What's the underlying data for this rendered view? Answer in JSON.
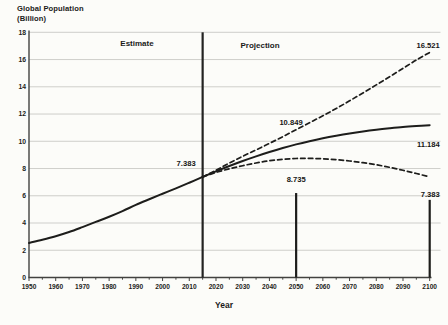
{
  "chart_data": {
    "type": "line",
    "title_line1": "Global Population",
    "title_line2": "(Billion)",
    "xlabel": "Year",
    "xlim": [
      1950,
      2100
    ],
    "ylim": [
      0,
      18
    ],
    "x_ticks": [
      1950,
      1960,
      1970,
      1980,
      1990,
      2000,
      2010,
      2020,
      2030,
      2040,
      2050,
      2060,
      2070,
      2080,
      2090,
      2100
    ],
    "x_minor_tick_step": 5,
    "y_ticks": [
      0,
      2,
      4,
      6,
      8,
      10,
      12,
      14,
      16,
      18
    ],
    "grid": "horizontal",
    "legend": "none",
    "colors": {
      "line": "#1d1d1b",
      "grid": "#cacac5",
      "axis": "#424240",
      "text": "#1b1b19",
      "background": "#fcfcf9"
    },
    "divider": {
      "year": 2015,
      "left_label": "Estimate",
      "right_label": "Projection"
    },
    "series": [
      {
        "name": "estimate",
        "line_style": "solid",
        "x": [
          1950,
          1955,
          1960,
          1965,
          1970,
          1975,
          1980,
          1985,
          1990,
          1995,
          2000,
          2005,
          2010,
          2015
        ],
        "values": [
          2.536,
          2.772,
          3.033,
          3.339,
          3.7,
          4.079,
          4.458,
          4.871,
          5.331,
          5.744,
          6.145,
          6.542,
          6.958,
          7.383
        ]
      },
      {
        "name": "high-variant",
        "line_style": "dashed",
        "x": [
          2015,
          2020,
          2025,
          2030,
          2035,
          2040,
          2045,
          2050,
          2055,
          2060,
          2065,
          2070,
          2075,
          2080,
          2085,
          2090,
          2095,
          2100
        ],
        "values": [
          7.383,
          7.877,
          8.401,
          8.897,
          9.368,
          9.846,
          10.339,
          10.849,
          11.36,
          11.873,
          12.405,
          12.968,
          13.547,
          14.139,
          14.74,
          15.351,
          15.963,
          16.521
        ]
      },
      {
        "name": "medium-variant",
        "line_style": "solid",
        "x": [
          2015,
          2020,
          2025,
          2030,
          2035,
          2040,
          2045,
          2050,
          2055,
          2060,
          2065,
          2070,
          2075,
          2080,
          2085,
          2090,
          2095,
          2100
        ],
        "values": [
          7.383,
          7.795,
          8.185,
          8.551,
          8.893,
          9.21,
          9.504,
          9.772,
          10.009,
          10.222,
          10.409,
          10.577,
          10.724,
          10.851,
          10.959,
          11.055,
          11.126,
          11.184
        ]
      },
      {
        "name": "low-variant",
        "line_style": "dashed",
        "x": [
          2015,
          2020,
          2025,
          2030,
          2035,
          2040,
          2045,
          2050,
          2055,
          2060,
          2065,
          2070,
          2075,
          2080,
          2085,
          2090,
          2095,
          2100
        ],
        "values": [
          7.383,
          7.713,
          7.981,
          8.206,
          8.406,
          8.57,
          8.673,
          8.735,
          8.744,
          8.712,
          8.651,
          8.551,
          8.429,
          8.276,
          8.086,
          7.87,
          7.634,
          7.383
        ]
      }
    ],
    "annotations": [
      {
        "id": "pop-2015",
        "text": "7.383",
        "year": 2015,
        "value": 7.383
      },
      {
        "id": "high-2050",
        "text": "10.849",
        "year": 2050,
        "value": 10.849
      },
      {
        "id": "high-2100",
        "text": "16.521",
        "year": 2100,
        "value": 16.521
      },
      {
        "id": "medium-2100",
        "text": "11.184",
        "year": 2100,
        "value": 11.184
      },
      {
        "id": "low-2050",
        "text": "8.735",
        "year": 2050,
        "value": 8.735
      },
      {
        "id": "low-2100",
        "text": "7.383",
        "year": 2100,
        "value": 7.383
      }
    ],
    "value_markers": [
      {
        "year": 2050,
        "top_value": 6.2
      },
      {
        "year": 2100,
        "top_value": 5.7
      }
    ]
  }
}
